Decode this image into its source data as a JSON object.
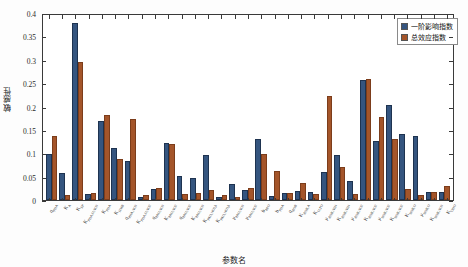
{
  "chart_data": {
    "type": "bar",
    "title": "",
    "xlabel": "参数名",
    "ylabel": "敏感性",
    "ylim": [
      0,
      0.4
    ],
    "ytick_labels": [
      "0",
      "0.05",
      "0.1",
      "0.15",
      "0.2",
      "0.25",
      "0.3",
      "0.35",
      "0.4"
    ],
    "ytick_values": [
      0,
      0.05,
      0.1,
      0.15,
      0.2,
      0.25,
      0.3,
      0.35,
      0.4
    ],
    "grid": false,
    "legend_position": "top-right",
    "legend": [
      "一阶影响指数",
      "总效应指数"
    ],
    "colors": {
      "first_order": "#35557f",
      "total_effect": "#a4552a"
    },
    "categories": [
      "q_PHA",
      "K_A",
      "K_SP",
      "K_PHA,O,NO3",
      "K_PHA",
      "K_HMB",
      "q_PHA,NO3",
      "K_PHA,O,NO2",
      "q_PAO,NO3",
      "K_PAO,NO2",
      "q_PAO,NO2",
      "K_PAO,NO3",
      "K_PAO,NO2,b",
      "K_PAO,NO3,b",
      "μ_PAO,NO3",
      "μ_PAO,NO2",
      "b_PAO",
      "b_PHA",
      "q_AOB",
      "K_AOB,A",
      "K_O,TO",
      "μ_AOB,NH4",
      "K_AOB,NH4",
      "μ_AOB,NO2",
      "K_AOB,NO2",
      "μ_NOB,NO2",
      "K_NOB,NO2",
      "K_NOB,O",
      "μ_NOB,O",
      "K_NOB,NO3",
      "K_OHO"
    ],
    "series": [
      {
        "name": "一阶影响指数",
        "values": [
          0.095,
          0.053,
          0.375,
          0.008,
          0.165,
          0.108,
          0.08,
          0.003,
          0.019,
          0.117,
          0.047,
          0.042,
          0.091,
          0.003,
          0.03,
          0.018,
          0.126,
          0.004,
          0.011,
          0.016,
          0.012,
          0.055,
          0.091,
          0.036,
          0.253,
          0.122,
          0.199,
          0.137,
          0.133,
          0.013,
          0.012
        ]
      },
      {
        "name": "总效应指数",
        "values": [
          0.133,
          0.007,
          0.292,
          0.011,
          0.178,
          0.083,
          0.168,
          0.006,
          0.022,
          0.115,
          0.008,
          0.01,
          0.018,
          0.006,
          0.003,
          0.022,
          0.095,
          0.057,
          0.01,
          0.033,
          0.008,
          0.219,
          0.067,
          0.009,
          0.255,
          0.174,
          0.126,
          0.019,
          0.007,
          0.013,
          0.025
        ]
      }
    ]
  }
}
